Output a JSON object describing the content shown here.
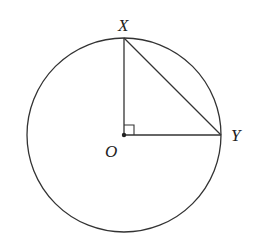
{
  "diagram": {
    "type": "geometry",
    "circle": {
      "center": "O",
      "cx": 124,
      "cy": 135,
      "r": 97
    },
    "points": {
      "X": {
        "label": "X",
        "x": 124,
        "y": 38
      },
      "O": {
        "label": "O",
        "x": 124,
        "y": 135
      },
      "Y": {
        "label": "Y",
        "x": 221,
        "y": 135
      }
    },
    "segments": [
      "OX",
      "OY",
      "XY"
    ],
    "right_angle_at": "O",
    "stroke_color": "#333333"
  }
}
